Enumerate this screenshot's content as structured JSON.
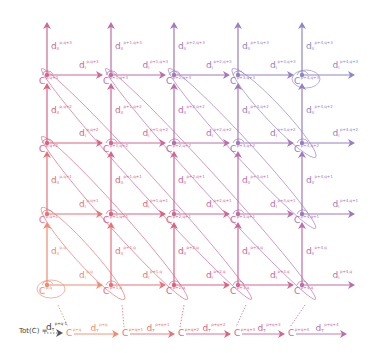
{
  "diagram": {
    "colors": {
      "orange": "#f08a70",
      "pink": "#e0607e",
      "magenta": "#c86a9e",
      "purple": "#9a7cc0",
      "lavender": "#8f86c6",
      "text_dark": "#444444"
    },
    "grid": {
      "columns_x": [
        47,
        111,
        174,
        238,
        302
      ],
      "rows_y": [
        75,
        143,
        214,
        285
      ],
      "column_p_labels": [
        "p",
        "p+1",
        "p+2",
        "p+3",
        "p+4"
      ],
      "row_q_labels": [
        "q+3",
        "q+2",
        "q+1",
        "q"
      ],
      "column_colors": [
        "#e8708a",
        "#e06a86",
        "#c86a9e",
        "#a47ab8",
        "#8f86c6"
      ]
    },
    "nodes": [
      {
        "label": "C",
        "sup": "p,q+3"
      },
      {
        "label": "C",
        "sup": "p+1,q+3"
      },
      {
        "label": "C",
        "sup": "p+2,q+3"
      },
      {
        "label": "C",
        "sup": "p+3,q+3"
      },
      {
        "label": "C",
        "sup": "p+4,q+3"
      },
      {
        "label": "C",
        "sup": "p,q+2"
      },
      {
        "label": "C",
        "sup": "p+1,q+2"
      },
      {
        "label": "C",
        "sup": "p+2,q+2"
      },
      {
        "label": "C",
        "sup": "p+3,q+2"
      },
      {
        "label": "C",
        "sup": "p+4,q+2"
      },
      {
        "label": "C",
        "sup": "p,q+1"
      },
      {
        "label": "C",
        "sup": "p+1,q+1"
      },
      {
        "label": "C",
        "sup": "p+2,q+1"
      },
      {
        "label": "C",
        "sup": "p+3,q+1"
      },
      {
        "label": "C",
        "sup": "p+4,q+1"
      },
      {
        "label": "C",
        "sup": "p,q"
      },
      {
        "label": "C",
        "sup": "p+1,q"
      },
      {
        "label": "C",
        "sup": "p+2,q"
      },
      {
        "label": "C",
        "sup": "p+3,q"
      },
      {
        "label": "C",
        "sup": "p+4,q"
      }
    ],
    "horizontal_differentials": {
      "symbol": "d",
      "sub": "I",
      "labels": [
        [
          "p,q+3",
          "p+1,q+3",
          "p+2,q+3",
          "p+3,q+3",
          "p+4,q+3"
        ],
        [
          "p,q+2",
          "p+1,q+2",
          "p+2,q+2",
          "p+3,q+2",
          "p+4,q+2"
        ],
        [
          "p,q+1",
          "p+1,q+1",
          "p+2,q+1",
          "p+3,q+1",
          "p+4,q+1"
        ],
        [
          "p,q",
          "p+1,q",
          "p+2,q",
          "p+3,q",
          "p+4,q"
        ]
      ]
    },
    "vertical_differentials": {
      "symbol": "d",
      "sub": "II",
      "labels": [
        [
          "p,q+3",
          "p+1,q+3",
          "p+2,q+3",
          "p+3,q+3",
          "p+4,q+3"
        ],
        [
          "p,q+2",
          "p+1,q+2",
          "p+2,q+2",
          "p+3,q+2",
          "p+4,q+2"
        ],
        [
          "p,q+1",
          "p+1,q+1",
          "p+2,q+1",
          "p+3,q+1",
          "p+4,q+1"
        ],
        [
          "p,q",
          "p+1,q",
          "p+2,q",
          "p+3,q",
          "p+4,q"
        ]
      ]
    },
    "total_complex": {
      "prefix": "Tot(C) =",
      "incoming_differential": {
        "symbol": "d",
        "sub": "T",
        "sup": "p+q-1"
      },
      "terms": [
        {
          "label": "C",
          "sup": "p+q"
        },
        {
          "label": "C",
          "sup": "p+q+1"
        },
        {
          "label": "C",
          "sup": "p+q+2"
        },
        {
          "label": "C",
          "sup": "p+q+3"
        },
        {
          "label": "C",
          "sup": "p+q+4"
        }
      ],
      "differentials": [
        {
          "symbol": "d",
          "sub": "T",
          "sup": "p+q"
        },
        {
          "symbol": "d",
          "sub": "T",
          "sup": "p+q+1"
        },
        {
          "symbol": "d",
          "sub": "T",
          "sup": "p+q+2"
        },
        {
          "symbol": "d",
          "sub": "T",
          "sup": "p+q+3"
        },
        {
          "symbol": "d",
          "sub": "T",
          "sup": "p+q+4"
        }
      ],
      "terms_x": [
        66,
        122,
        178,
        234,
        288
      ],
      "row_y": 333
    }
  }
}
